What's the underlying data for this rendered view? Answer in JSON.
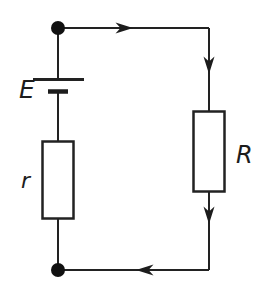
{
  "diagram": {
    "type": "circuit-diagram",
    "labels": {
      "emf": "E",
      "internal_resistance": "r",
      "external_resistance": "R"
    },
    "components": [
      {
        "name": "battery-emf-source",
        "label": "E",
        "symbol": "long-and-short-plate-pair",
        "position": "left-branch-upper"
      },
      {
        "name": "internal-resistor",
        "label": "r",
        "symbol": "rectangle",
        "position": "left-branch-lower"
      },
      {
        "name": "external-resistor",
        "label": "R",
        "symbol": "rectangle",
        "position": "right-branch"
      },
      {
        "name": "junction-top",
        "symbol": "filled-dot",
        "position": "top-left-corner"
      },
      {
        "name": "junction-bottom",
        "symbol": "filled-dot",
        "position": "bottom-left-corner"
      }
    ],
    "current_direction": "clockwise",
    "current_arrows": [
      "rightward on top wire",
      "downward on right wire above R",
      "downward on right wire below R",
      "leftward on bottom wire"
    ],
    "colors": {
      "line": "#222222",
      "background": "#ffffff"
    }
  }
}
